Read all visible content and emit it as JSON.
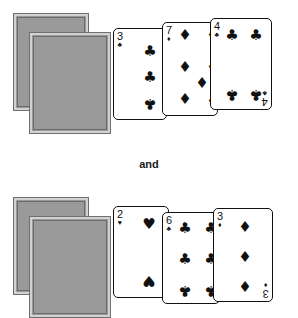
{
  "page": {
    "background_color": "#ffffff",
    "connector_label": "and"
  },
  "palette": {
    "card_face": "#ffffff",
    "card_ink": "#111111",
    "card_back_fill": "#9a9a9a",
    "card_back_border": "#d2d2d2",
    "card_back_outline": "#6f6f6f"
  },
  "glyphs": {
    "club": "♣",
    "diamond": "♦",
    "heart": "♥",
    "spade": "♠"
  },
  "groups": [
    {
      "id": "top-group",
      "face_down_stack": {
        "count": 2,
        "label": "face-down-card-back"
      },
      "cards": [
        {
          "rank": "3",
          "suit": "club",
          "suit_symbol": "♣",
          "name": "three-of-clubs",
          "pip_count": 3
        },
        {
          "rank": "7",
          "suit": "diamond",
          "suit_symbol": "♦",
          "name": "seven-of-diamonds",
          "pip_count": 7
        },
        {
          "rank": "4",
          "suit": "club",
          "suit_symbol": "♣",
          "name": "four-of-clubs",
          "pip_count": 4
        }
      ]
    },
    {
      "id": "bottom-group",
      "face_down_stack": {
        "count": 2,
        "label": "face-down-card-back"
      },
      "cards": [
        {
          "rank": "2",
          "suit": "heart",
          "suit_symbol": "♥",
          "name": "two-of-hearts",
          "pip_count": 2
        },
        {
          "rank": "6",
          "suit": "club",
          "suit_symbol": "♣",
          "name": "six-of-clubs",
          "pip_count": 6
        },
        {
          "rank": "3",
          "suit": "diamond",
          "suit_symbol": "♦",
          "name": "three-of-diamonds",
          "pip_count": 3
        }
      ]
    }
  ]
}
